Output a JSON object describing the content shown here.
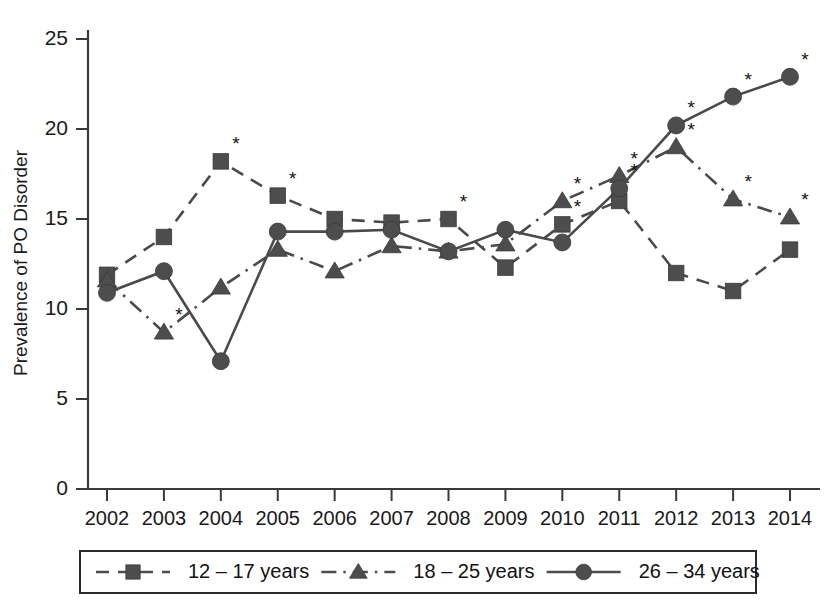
{
  "chart_data": {
    "type": "line",
    "title": "",
    "xlabel": "",
    "ylabel": "Prevalence of PO Disorder",
    "categories": [
      "2002",
      "2003",
      "2004",
      "2005",
      "2006",
      "2007",
      "2008",
      "2009",
      "2010",
      "2011",
      "2012",
      "2013",
      "2014"
    ],
    "x": [
      2002,
      2003,
      2004,
      2005,
      2006,
      2007,
      2008,
      2009,
      2010,
      2011,
      2012,
      2013,
      2014
    ],
    "ylim": [
      0,
      25
    ],
    "xlim": [
      2002,
      2014
    ],
    "yticks": [
      0,
      5,
      10,
      15,
      20,
      25
    ],
    "grid": false,
    "legend_position": "bottom",
    "annotation_symbol": "*",
    "annotation_meaning": "statistically significant difference",
    "series": [
      {
        "name": "12 – 17 years",
        "marker": "square",
        "linestyle": "dashed",
        "color": "#4d4d4d",
        "values": [
          11.9,
          14.0,
          18.2,
          16.3,
          15.0,
          14.8,
          15.0,
          12.3,
          14.7,
          16.0,
          12.0,
          11.0,
          13.3
        ],
        "significant": [
          false,
          false,
          true,
          true,
          false,
          false,
          true,
          false,
          true,
          false,
          false,
          false,
          false
        ]
      },
      {
        "name": "18 – 25 years",
        "marker": "triangle",
        "linestyle": "dashdot",
        "color": "#4d4d4d",
        "values": [
          11.6,
          8.7,
          11.2,
          13.3,
          12.1,
          13.5,
          13.2,
          13.6,
          16.0,
          17.4,
          19.0,
          16.1,
          15.1
        ],
        "significant": [
          false,
          true,
          false,
          false,
          false,
          false,
          false,
          false,
          true,
          true,
          true,
          true,
          true
        ]
      },
      {
        "name": "26 – 34 years",
        "marker": "circle",
        "linestyle": "solid",
        "color": "#4d4d4d",
        "values": [
          10.9,
          12.1,
          7.1,
          14.3,
          14.3,
          14.4,
          13.2,
          14.4,
          13.7,
          16.7,
          20.2,
          21.8,
          22.9
        ],
        "significant": [
          false,
          false,
          false,
          false,
          false,
          false,
          false,
          false,
          false,
          true,
          true,
          true,
          true
        ]
      }
    ]
  },
  "legend": {
    "entries": [
      {
        "label": "12 – 17 years"
      },
      {
        "label": "18 – 25 years"
      },
      {
        "label": "26 – 34 years"
      }
    ]
  },
  "axes": {
    "y_label": "Prevalence of PO Disorder",
    "y_ticks": [
      "0",
      "5",
      "10",
      "15",
      "20",
      "25"
    ],
    "x_ticks": [
      "2002",
      "2003",
      "2004",
      "2005",
      "2006",
      "2007",
      "2008",
      "2009",
      "2010",
      "2011",
      "2012",
      "2013",
      "2014"
    ]
  }
}
